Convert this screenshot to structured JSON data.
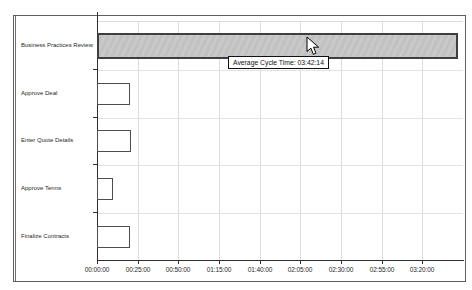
{
  "tooltip": {
    "text": "Average Cycle Time: 03:42:14"
  },
  "chart_data": {
    "type": "bar",
    "orientation": "horizontal",
    "title": "",
    "xlabel": "",
    "ylabel": "",
    "categories": [
      "Business Practices Review",
      "Approve Deal",
      "Enter Quote Details",
      "Approve Terms",
      "Finalize Contracts"
    ],
    "values_minutes": [
      222.2,
      20,
      21,
      10,
      20
    ],
    "values_hhmmss": [
      "03:42:14",
      "00:20:00",
      "00:21:00",
      "00:10:00",
      "00:20:00"
    ],
    "highlighted_index": 0,
    "x_ticks": [
      "00:00:00",
      "00:25:00",
      "00:50:00",
      "01:15:00",
      "01:40:00",
      "02:05:00",
      "02:30:00",
      "02:55:00",
      "03:20:00"
    ],
    "x_tick_minutes": [
      0,
      25,
      50,
      75,
      100,
      125,
      150,
      175,
      200
    ],
    "axis_max_minutes": 225,
    "grid": true,
    "legend": "none",
    "tooltip_target": "Business Practices Review",
    "tooltip_text": "Average Cycle Time: 03:42:14",
    "colors": {
      "highlight_fill": "#c6c6c6",
      "highlight_border": "#3f3f3f",
      "bar_fill": "#ffffff",
      "bar_border": "#4f4f4f",
      "gridline": "#dcdcdc",
      "axis": "#2f2f2f"
    }
  }
}
